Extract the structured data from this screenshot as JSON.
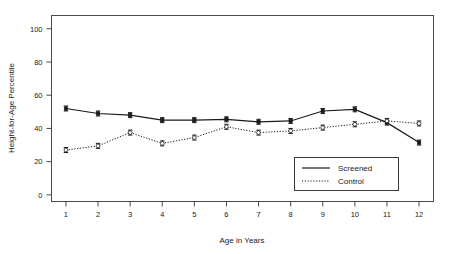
{
  "figure": {
    "background_color": "#ffffff",
    "ink_color": "#1a1a1a"
  },
  "chart_data": {
    "type": "line",
    "title": "",
    "xlabel": "Age in Years",
    "ylabel": "Height-for-Age Percentile",
    "x": [
      1,
      2,
      3,
      4,
      5,
      6,
      7,
      8,
      9,
      10,
      11,
      12
    ],
    "xtick_labels": [
      "1",
      "2",
      "3",
      "4",
      "5",
      "6",
      "7",
      "8",
      "9",
      "10",
      "11",
      "12"
    ],
    "ytick_labels": [
      "0",
      "20",
      "40",
      "60",
      "80",
      "100"
    ],
    "yticks": [
      0,
      20,
      40,
      60,
      80,
      100
    ],
    "xlim": [
      0.55,
      12.45
    ],
    "ylim": [
      -4,
      108
    ],
    "grid": false,
    "legend_position": "lower right",
    "series": [
      {
        "name": "Screened",
        "line_style": "solid",
        "marker": "filled",
        "values": [
          52,
          49,
          48,
          45,
          45,
          45.5,
          44,
          44.5,
          50.5,
          51.5,
          43.5,
          31.5
        ],
        "err_low": [
          50.5,
          47.5,
          46.5,
          43.5,
          43.5,
          44,
          42.5,
          43,
          49,
          50,
          42,
          30
        ],
        "err_high": [
          53.5,
          50.5,
          49.5,
          46.5,
          46.5,
          47,
          45.5,
          46,
          52,
          53,
          45,
          33
        ]
      },
      {
        "name": "Control",
        "line_style": "dotted",
        "marker": "open",
        "values": [
          27,
          29.5,
          37.5,
          31,
          34.5,
          41,
          37.5,
          38.5,
          40.5,
          42.5,
          44.5,
          43
        ],
        "err_low": [
          25.5,
          28,
          36,
          29.5,
          33,
          39.5,
          36,
          37,
          39,
          41,
          43,
          41.5
        ],
        "err_high": [
          28.5,
          31,
          39,
          32.5,
          36,
          42.5,
          39,
          40,
          42,
          44,
          46,
          44.5
        ]
      }
    ]
  },
  "legend": {
    "entries": [
      {
        "label": "Screened",
        "style": "solid"
      },
      {
        "label": "Control",
        "style": "dotted"
      }
    ]
  }
}
